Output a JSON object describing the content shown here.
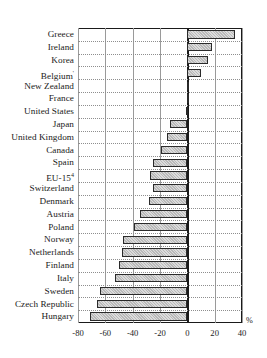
{
  "chart_data": {
    "type": "bar",
    "orientation": "horizontal",
    "title": "",
    "xlabel": "%",
    "ylabel": "",
    "xlim": [
      -80,
      40
    ],
    "xticks": [
      -80,
      -60,
      -40,
      -20,
      0,
      20,
      40
    ],
    "xtick_labels": [
      "-80",
      "-60",
      "-40",
      "-20",
      "0",
      "20",
      "40"
    ],
    "grid": true,
    "grid_axis": "both",
    "legend": null,
    "categories": [
      "Greece",
      "Ireland",
      "Korea",
      "Belgium",
      "New Zealand",
      "France",
      "United States",
      "Japan",
      "United Kingdom",
      "Canada",
      "Spain",
      "EU-15",
      "Switzerland",
      "Denmark",
      "Austria",
      "Poland",
      "Norway",
      "Netherlands",
      "Finland",
      "Italy",
      "Sweden",
      "Czech Republic",
      "Hungary"
    ],
    "category_marks": {
      "Belgium": "'",
      "EU-15": "4"
    },
    "values": [
      35,
      18,
      15,
      10,
      1,
      0,
      -1,
      -13,
      -15,
      -19,
      -25,
      -27,
      -25,
      -28,
      -35,
      -39,
      -47,
      -48,
      -50,
      -53,
      -64,
      -66,
      -71
    ],
    "unit": "%",
    "bar_fill": "#cccccc",
    "bar_edge": "#2a2a2a",
    "axis_color": "#1a1a1a",
    "grid_color": "#8e8e8e"
  }
}
